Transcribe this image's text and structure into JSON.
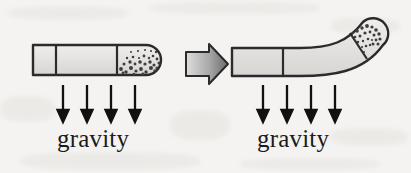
{
  "figure": {
    "background_color": "#f4f3f1",
    "outline_color": "#2b2b2b",
    "tube_fill_color": "#e3e2e0",
    "speckle_color": "#3a3a3a",
    "arrow_color": "#111111"
  },
  "panels": [
    {
      "id": "before",
      "orientation": "horizontal",
      "description": "Straight horizontal root tip with statoliths settled along the lower side of the rounded tip",
      "segment_count": 3,
      "gravity": {
        "label": "gravity",
        "arrow_count": 4,
        "direction": "down"
      }
    },
    {
      "id": "after",
      "orientation": "curved-upward",
      "description": "Root tip curved upward; statoliths resettled along the upper side of the rounded tip",
      "segment_count": 3,
      "gravity": {
        "label": "gravity",
        "arrow_count": 4,
        "direction": "down"
      }
    }
  ],
  "transition": {
    "icon": "block-arrow-right-icon",
    "direction": "right",
    "fill_start": "#d9d9d9",
    "fill_end": "#6f6f6f"
  }
}
